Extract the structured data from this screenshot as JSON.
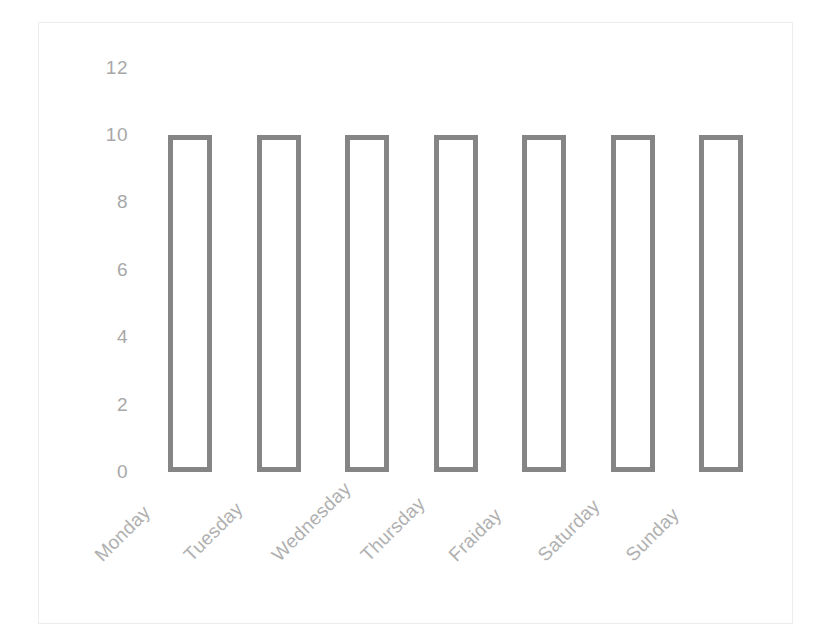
{
  "chart_data": {
    "type": "bar",
    "title": "",
    "subtitle": "",
    "xlabel": "",
    "ylabel": "",
    "categories": [
      "Monday",
      "Tuesday",
      "Wednesday",
      "Thursday",
      "Fraiday",
      "Saturday",
      "Sunday"
    ],
    "values": [
      10,
      10,
      10,
      10,
      10,
      10,
      10
    ],
    "yticks": [
      "0",
      "2",
      "4",
      "6",
      "8",
      "10",
      "12"
    ],
    "ylim": [
      0,
      12
    ],
    "grid": false,
    "legend": false,
    "legend_position": "none",
    "annotations": [],
    "style": {
      "bar_fill": "#ffffff",
      "bar_stroke": "#858585",
      "bar_stroke_width": 5,
      "tick_label_color": "#a8a8a8",
      "category_label_color": "#b0b0b0",
      "category_label_rotation": -45,
      "frame_color": "#ededed",
      "background": "#ffffff",
      "axis_line": false
    }
  }
}
